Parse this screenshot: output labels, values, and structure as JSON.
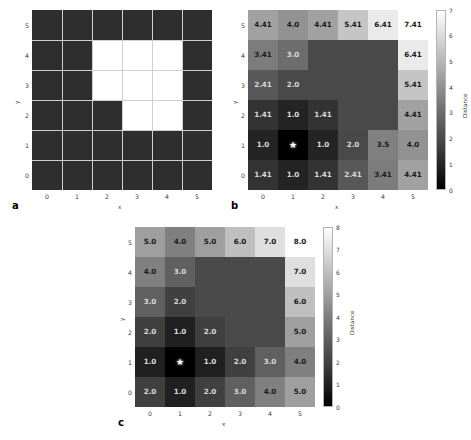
{
  "figure": {
    "panels": [
      {
        "letter": "a",
        "xlabel": "x",
        "ylabel": "y",
        "xticks": [
          "0",
          "1",
          "2",
          "3",
          "4",
          "5"
        ],
        "yticks": [
          "0",
          "1",
          "2",
          "3",
          "4",
          "5"
        ],
        "free_color": "#2e2e2e",
        "obstacle_color": "#ffffff",
        "gridline_color": "#cfcfcf"
      },
      {
        "letter": "b",
        "xlabel": "x",
        "ylabel": "y",
        "xticks": [
          "0",
          "1",
          "2",
          "3",
          "4",
          "5"
        ],
        "yticks": [
          "0",
          "1",
          "2",
          "3",
          "4",
          "5"
        ],
        "colorbar": {
          "title": "Distance",
          "ticks": [
            "0",
            "1",
            "2",
            "3",
            "4",
            "5",
            "6",
            "7"
          ],
          "vmin": 0,
          "vmax": 7
        }
      },
      {
        "letter": "c",
        "xlabel": "x",
        "ylabel": "y",
        "xticks": [
          "0",
          "1",
          "2",
          "3",
          "4",
          "5"
        ],
        "yticks": [
          "0",
          "1",
          "2",
          "3",
          "4",
          "5"
        ],
        "colorbar": {
          "title": "Distance",
          "ticks": [
            "0",
            "1",
            "2",
            "3",
            "4",
            "5",
            "6",
            "7",
            "8"
          ],
          "vmin": 0,
          "vmax": 8
        }
      }
    ],
    "source_marker": "★",
    "source_cell": [
      1,
      1
    ]
  },
  "chart_data": [
    {
      "type": "heatmap",
      "panel": "a",
      "title": "",
      "xlabel": "x",
      "ylabel": "y",
      "x": [
        0,
        1,
        2,
        3,
        4,
        5
      ],
      "y": [
        0,
        1,
        2,
        3,
        4,
        5
      ],
      "legend": [],
      "grid": true,
      "note": "binary occupancy map: 1 = obstacle (white), 0 = free (dark)",
      "rows_top_to_bottom": [
        [
          0,
          0,
          0,
          0,
          0,
          0
        ],
        [
          0,
          0,
          1,
          1,
          1,
          0
        ],
        [
          0,
          0,
          1,
          1,
          1,
          0
        ],
        [
          0,
          0,
          0,
          1,
          1,
          0
        ],
        [
          0,
          0,
          0,
          0,
          0,
          0
        ],
        [
          0,
          0,
          0,
          0,
          0,
          0
        ]
      ]
    },
    {
      "type": "heatmap",
      "panel": "b",
      "title": "",
      "xlabel": "x",
      "ylabel": "y",
      "x": [
        0,
        1,
        2,
        3,
        4,
        5
      ],
      "y": [
        0,
        1,
        2,
        3,
        4,
        5
      ],
      "grid": false,
      "zlim": [
        0,
        7
      ],
      "colorbar_label": "Distance",
      "note": "geodesic (octile) distance from source at (1,1); obstacle cells unlabeled",
      "rows_top_to_bottom": [
        [
          4.41,
          4.0,
          4.41,
          5.41,
          6.41,
          7.41
        ],
        [
          3.41,
          3.0,
          null,
          null,
          null,
          6.41
        ],
        [
          2.41,
          2.0,
          null,
          null,
          null,
          5.41
        ],
        [
          1.41,
          1.0,
          1.41,
          null,
          null,
          4.41
        ],
        [
          1.0,
          0.0,
          1.0,
          2.0,
          3.5,
          4.0
        ],
        [
          1.41,
          1.0,
          1.41,
          2.41,
          3.41,
          4.41
        ]
      ],
      "labels_top_to_bottom": [
        [
          "4.41",
          "4.0",
          "4.41",
          "5.41",
          "6.41",
          "7.41"
        ],
        [
          "3.41",
          "3.0",
          "",
          "",
          "",
          "6.41"
        ],
        [
          "2.41",
          "2.0",
          "",
          "",
          "",
          "5.41"
        ],
        [
          "1.41",
          "1.0",
          "1.41",
          "",
          "",
          "4.41"
        ],
        [
          "1.0",
          "★",
          "1.0",
          "2.0",
          "3.5",
          "4.0"
        ],
        [
          "1.41",
          "1.0",
          "1.41",
          "2.41",
          "3.41",
          "4.41"
        ]
      ]
    },
    {
      "type": "heatmap",
      "panel": "c",
      "title": "",
      "xlabel": "x",
      "ylabel": "y",
      "x": [
        0,
        1,
        2,
        3,
        4,
        5
      ],
      "y": [
        0,
        1,
        2,
        3,
        4,
        5
      ],
      "grid": false,
      "zlim": [
        0,
        8
      ],
      "colorbar_label": "Distance",
      "note": "Manhattan (4-connected) distance from source at (1,1); obstacle cells unlabeled",
      "rows_top_to_bottom": [
        [
          5.0,
          4.0,
          5.0,
          6.0,
          7.0,
          8.0
        ],
        [
          4.0,
          3.0,
          null,
          null,
          null,
          7.0
        ],
        [
          3.0,
          2.0,
          null,
          null,
          null,
          6.0
        ],
        [
          2.0,
          1.0,
          2.0,
          null,
          null,
          5.0
        ],
        [
          1.0,
          0.0,
          1.0,
          2.0,
          3.0,
          4.0
        ],
        [
          2.0,
          1.0,
          2.0,
          3.0,
          4.0,
          5.0
        ]
      ],
      "labels_top_to_bottom": [
        [
          "5.0",
          "4.0",
          "5.0",
          "6.0",
          "7.0",
          "8.0"
        ],
        [
          "4.0",
          "3.0",
          "",
          "",
          "",
          "7.0"
        ],
        [
          "3.0",
          "2.0",
          "",
          "",
          "",
          "6.0"
        ],
        [
          "2.0",
          "1.0",
          "2.0",
          "",
          "",
          "5.0"
        ],
        [
          "1.0",
          "★",
          "1.0",
          "2.0",
          "3.0",
          "4.0"
        ],
        [
          "2.0",
          "1.0",
          "2.0",
          "3.0",
          "4.0",
          "5.0"
        ]
      ]
    }
  ]
}
